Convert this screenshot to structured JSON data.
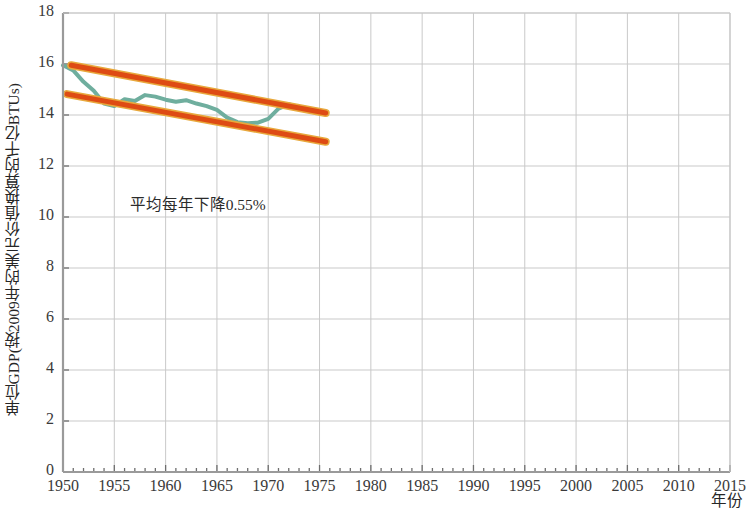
{
  "chart_data": {
    "type": "line",
    "title": "",
    "xlabel": "年份",
    "ylabel": "单位GDP(按2009年的美元价值换算的千亿BTUs)",
    "xlim": [
      1950,
      2015
    ],
    "ylim": [
      0,
      18
    ],
    "xticks": [
      1950,
      1955,
      1960,
      1965,
      1970,
      1975,
      1980,
      1985,
      1990,
      1995,
      2000,
      2005,
      2010,
      2015
    ],
    "yticks": [
      0,
      2,
      4,
      6,
      8,
      10,
      12,
      14,
      16,
      18
    ],
    "xtick_labels": [
      "1950",
      "1955",
      "1960",
      "1965",
      "1970",
      "1975",
      "1980",
      "1985",
      "1990",
      "1995",
      "2000",
      "2005",
      "2010",
      "2015"
    ],
    "ytick_labels": [
      "0",
      "2",
      "4",
      "6",
      "8",
      "10",
      "12",
      "14",
      "16",
      "18"
    ],
    "x_minor_tick_interval": 1,
    "grid": true,
    "grid_color": "#c9c9c9",
    "legend": "none",
    "annotations": [
      {
        "text": "平均每年下降0.55%",
        "x": 1956.5,
        "y": 10.6
      }
    ],
    "series": [
      {
        "name": "单位GDP能耗",
        "type": "line",
        "color": "#6fae9e",
        "width": 4,
        "x": [
          1950,
          1951,
          1952,
          1953,
          1954,
          1955,
          1956,
          1957,
          1958,
          1959,
          1960,
          1961,
          1962,
          1963,
          1964,
          1965,
          1966,
          1967,
          1968,
          1969,
          1970,
          1971,
          1972,
          1973,
          1974,
          1975
        ],
        "values": [
          15.95,
          15.75,
          15.3,
          14.95,
          14.45,
          14.35,
          14.62,
          14.55,
          14.78,
          14.72,
          14.6,
          14.52,
          14.58,
          14.45,
          14.35,
          14.2,
          13.9,
          13.72,
          13.68,
          13.7,
          13.85,
          14.25,
          14.42,
          14.3,
          14.2,
          14.12
        ]
      },
      {
        "name": "趋势上界",
        "type": "trend-line",
        "color": "#de4b14",
        "width": 5,
        "x": [
          1950.8,
          1975.6
        ],
        "values": [
          15.95,
          14.08
        ]
      },
      {
        "name": "趋势下界",
        "type": "trend-line",
        "color": "#de4b14",
        "width": 5,
        "x": [
          1950.4,
          1975.6
        ],
        "values": [
          14.82,
          12.95
        ]
      }
    ]
  },
  "axis": {
    "y_axis_title": "单位GDP(按2009年的美元价值换算的千亿BTUs)",
    "x_axis_title": "年份"
  }
}
